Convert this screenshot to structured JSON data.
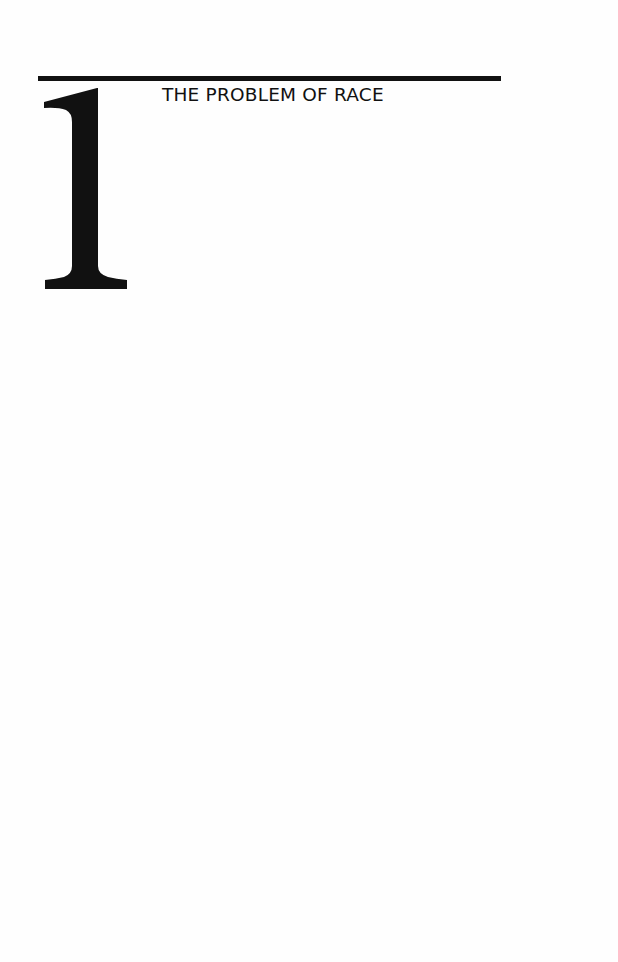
{
  "chapter": {
    "number": "1",
    "title": "THE PROBLEM OF RACE"
  },
  "colors": {
    "ink": "#111111",
    "paper": "#fefefe"
  }
}
